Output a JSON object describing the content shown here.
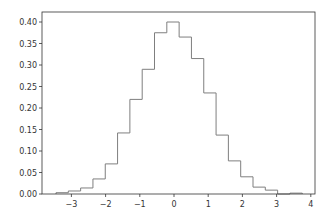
{
  "chart_data": {
    "type": "bar",
    "subtype": "histogram-step",
    "title": "",
    "xlabel": "",
    "ylabel": "",
    "xlim": [
      -3.85,
      4.2
    ],
    "ylim": [
      0.0,
      0.42
    ],
    "grid": false,
    "legend": null,
    "line_color": "#7f7f7f",
    "bin_edges": [
      -3.45,
      -3.09,
      -2.73,
      -2.37,
      -2.01,
      -1.65,
      -1.29,
      -0.93,
      -0.57,
      -0.21,
      0.15,
      0.51,
      0.87,
      1.23,
      1.59,
      1.95,
      2.31,
      2.67,
      3.03,
      3.39,
      3.75
    ],
    "values": [
      0.003,
      0.007,
      0.014,
      0.035,
      0.07,
      0.142,
      0.22,
      0.29,
      0.375,
      0.4,
      0.365,
      0.315,
      0.235,
      0.137,
      0.077,
      0.04,
      0.016,
      0.009,
      0.0,
      0.002
    ],
    "xticks": [
      -3,
      -2,
      -1,
      0,
      1,
      2,
      3,
      4
    ],
    "xtick_labels": [
      "−3",
      "−2",
      "−1",
      "0",
      "1",
      "2",
      "3",
      "4"
    ],
    "yticks": [
      0.0,
      0.05,
      0.1,
      0.15,
      0.2,
      0.25,
      0.3,
      0.35,
      0.4
    ],
    "ytick_labels": [
      "0.00",
      "0.05",
      "0.10",
      "0.15",
      "0.20",
      "0.25",
      "0.30",
      "0.35",
      "0.40"
    ]
  }
}
